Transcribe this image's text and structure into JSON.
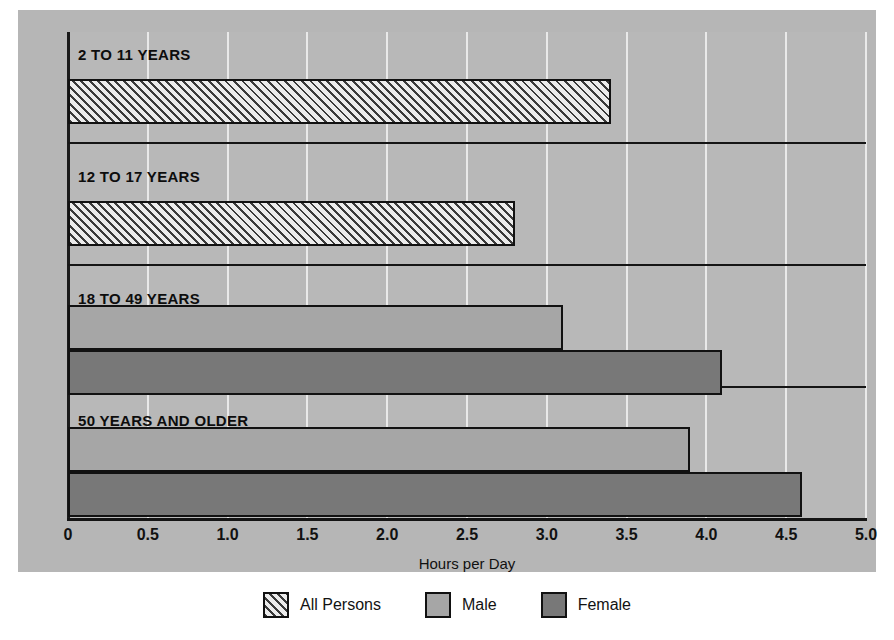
{
  "chart_data": {
    "type": "bar",
    "orientation": "horizontal",
    "title": "",
    "xlabel": "Hours per Day",
    "ylabel": "",
    "xlim": [
      0,
      5.0
    ],
    "xticks": [
      "0",
      "0.5",
      "1.0",
      "1.5",
      "2.0",
      "2.5",
      "3.0",
      "3.5",
      "4.0",
      "4.5",
      "5.0"
    ],
    "xtick_values": [
      0,
      0.5,
      1.0,
      1.5,
      2.0,
      2.5,
      3.0,
      3.5,
      4.0,
      4.5,
      5.0
    ],
    "grid": true,
    "grid_axis": "x",
    "legend_position": "bottom-center",
    "categories": [
      "2 TO 11 YEARS",
      "12 TO 17 YEARS",
      "18 TO 49 YEARS",
      "50 YEARS AND OLDER"
    ],
    "series": [
      {
        "name": "All Persons",
        "color": "#ececec",
        "pattern": "diagonal-hatch",
        "values": [
          3.4,
          2.8,
          null,
          null
        ]
      },
      {
        "name": "Male",
        "color": "#a6a6a6",
        "pattern": "solid",
        "values": [
          null,
          null,
          3.1,
          3.9
        ]
      },
      {
        "name": "Female",
        "color": "#787878",
        "pattern": "solid",
        "values": [
          null,
          null,
          4.1,
          4.6
        ]
      }
    ]
  },
  "axis": {
    "title": "Hours per Day",
    "ticks": [
      "0",
      "0.5",
      "1.0",
      "1.5",
      "2.0",
      "2.5",
      "3.0",
      "3.5",
      "4.0",
      "4.5",
      "5.0"
    ]
  },
  "groups": [
    {
      "label": "2 TO 11 YEARS",
      "bars": [
        {
          "series": "All Persons",
          "value": 3.4,
          "style": "series-all"
        }
      ]
    },
    {
      "label": "12 TO 17 YEARS",
      "bars": [
        {
          "series": "All Persons",
          "value": 2.8,
          "style": "series-all"
        }
      ]
    },
    {
      "label": "18 TO 49 YEARS",
      "bars": [
        {
          "series": "Male",
          "value": 3.1,
          "style": "series-male"
        },
        {
          "series": "Female",
          "value": 4.1,
          "style": "series-female"
        }
      ]
    },
    {
      "label": "50 YEARS AND OLDER",
      "bars": [
        {
          "series": "Male",
          "value": 3.9,
          "style": "series-male"
        },
        {
          "series": "Female",
          "value": 4.6,
          "style": "series-female"
        }
      ]
    }
  ],
  "legend": [
    {
      "label": "All Persons",
      "style": "series-all"
    },
    {
      "label": "Male",
      "style": "series-male"
    },
    {
      "label": "Female",
      "style": "series-female"
    }
  ]
}
